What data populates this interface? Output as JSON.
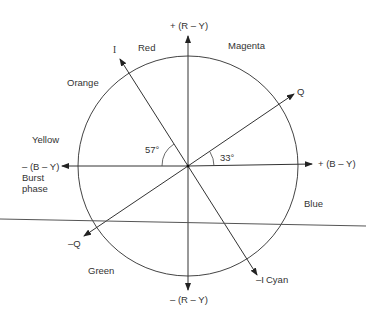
{
  "diagram": {
    "type": "color phase vector diagram",
    "axes": {
      "r_y_pos": "+ (R – Y)",
      "r_y_neg": "– (R – Y)",
      "b_y_pos": "+ (B – Y)",
      "b_y_neg": "– (B – Y)",
      "burst1": "Burst",
      "burst2": "phase",
      "i_pos": "I",
      "i_neg": "–I",
      "q_pos": "Q",
      "q_neg": "–Q"
    },
    "angles": {
      "i_angle": "57°",
      "q_angle": "33°"
    },
    "colors": {
      "red": "Red",
      "magenta": "Magenta",
      "orange": "Orange",
      "yellow": "Yellow",
      "blue": "Blue",
      "green": "Green",
      "cyan": "Cyan"
    }
  }
}
